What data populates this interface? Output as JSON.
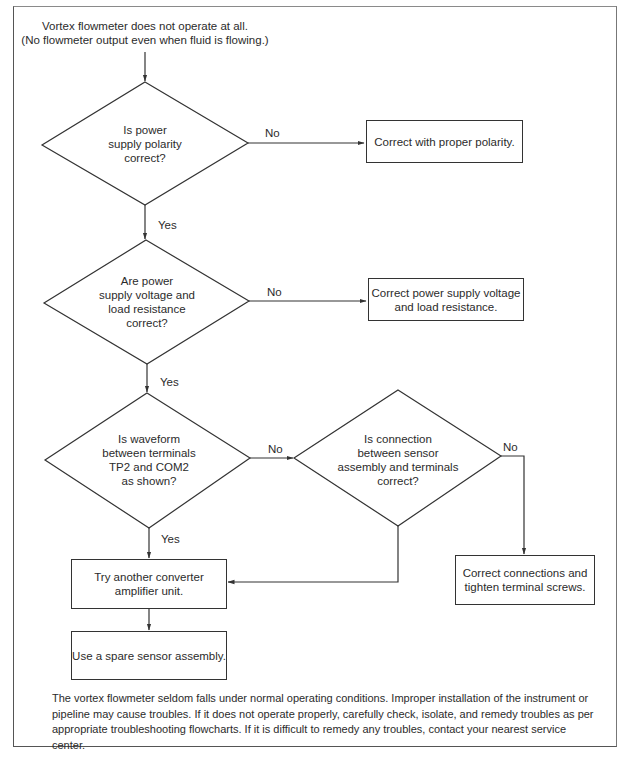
{
  "start": {
    "line1": "Vortex flowmeter does not operate at all.",
    "line2": "(No flowmeter output even when fluid is flowing.)"
  },
  "decisions": [
    {
      "id": "d1",
      "lines": [
        "Is power",
        "supply polarity",
        "correct?"
      ],
      "no_label": "No",
      "yes_label": "Yes"
    },
    {
      "id": "d2",
      "lines": [
        "Are power",
        "supply voltage and",
        "load resistance",
        "correct?"
      ],
      "no_label": "No",
      "yes_label": "Yes"
    },
    {
      "id": "d3",
      "lines": [
        "Is waveform",
        "between terminals",
        "TP2 and COM2",
        "as shown?"
      ],
      "no_label": "No",
      "yes_label": "Yes"
    },
    {
      "id": "d4",
      "lines": [
        "Is connection",
        "between sensor",
        "assembly and terminals",
        "correct?"
      ],
      "no_label": "No"
    }
  ],
  "actions": [
    {
      "id": "a1",
      "lines": [
        "Correct with proper polarity."
      ]
    },
    {
      "id": "a2",
      "lines": [
        "Correct power supply voltage",
        "and load resistance."
      ]
    },
    {
      "id": "a3",
      "lines": [
        "Try another converter",
        "amplifier unit."
      ]
    },
    {
      "id": "a4",
      "lines": [
        "Use a spare sensor assembly."
      ]
    },
    {
      "id": "a5",
      "lines": [
        "Correct connections and",
        "tighten terminal screws."
      ]
    }
  ],
  "footer": {
    "text": "The vortex flowmeter seldom falls under normal operating conditions. Improper installation of the instrument or pipeline may cause troubles. If it does not operate properly, carefully check, isolate, and remedy troubles as per appropriate troubleshooting flowcharts. If it is difficult to remedy any troubles, contact your nearest service center."
  },
  "colors": {
    "line": "#333333",
    "text": "#2b2b2b",
    "background": "#ffffff"
  }
}
